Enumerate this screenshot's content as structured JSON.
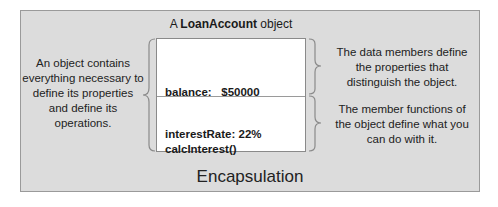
{
  "title": {
    "prefix": "A ",
    "class_name": "LoanAccount",
    "suffix": " object"
  },
  "object_box": {
    "data_members": [
      "balance:   $50000",
      "interestRate: 22%"
    ],
    "member_functions": [
      "calcInterest()"
    ]
  },
  "annotations": {
    "left": "An object contains everything necessary to define its properties and define its operations.",
    "right_data_members": "The data members define the properties that distinguish the object.",
    "right_member_functions": "The member functions of the object define what you can do with it."
  },
  "footer": "Encapsulation",
  "colors": {
    "background": "#dcdcdc",
    "object_fill": "#ffffff",
    "border": "#9a9a9a",
    "brace": "#8a8a8a"
  }
}
